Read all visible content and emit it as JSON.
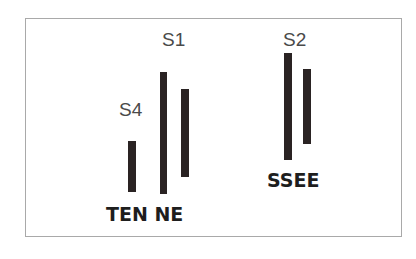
{
  "diagram": {
    "colors": {
      "background": "#ffffff",
      "frame": "#a9a9a9",
      "bar": "#2a2323",
      "label_light": "#4a4a4a",
      "label_bold": "#1e1e1e"
    },
    "labels": {
      "s1": "S1",
      "s2": "S2",
      "s4": "S4",
      "ten_ne": "TEN NE",
      "ssee": "SSEE"
    },
    "bars": [
      {
        "name": "bar-s4",
        "x": 128,
        "y": 141,
        "width": 8,
        "height": 51
      },
      {
        "name": "bar-s1-left",
        "x": 160,
        "y": 72,
        "width": 7,
        "height": 122
      },
      {
        "name": "bar-s1-right",
        "x": 181,
        "y": 89,
        "width": 8,
        "height": 88
      },
      {
        "name": "bar-s2-left",
        "x": 284,
        "y": 53,
        "width": 8,
        "height": 107
      },
      {
        "name": "bar-s2-right",
        "x": 303,
        "y": 69,
        "width": 8,
        "height": 75
      }
    ]
  }
}
